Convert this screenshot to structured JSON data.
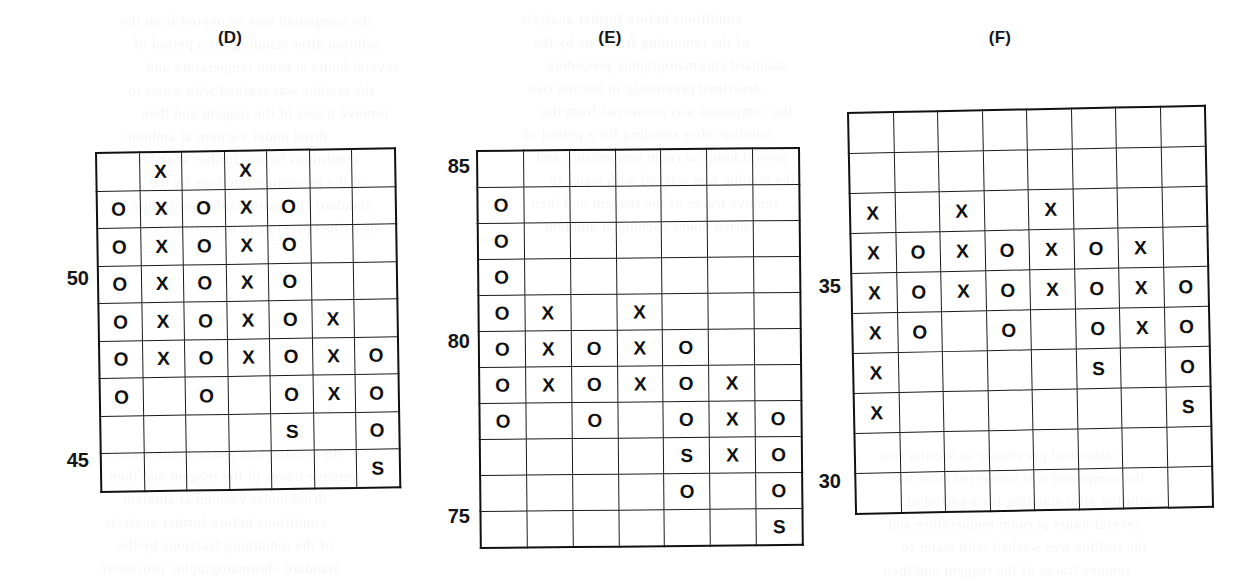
{
  "figure": {
    "background_color": "#ffffff",
    "ink_color": "#111111",
    "symbols": {
      "x": "X",
      "o": "O",
      "s": "S",
      "blank": ""
    }
  },
  "panels": [
    {
      "id": "panel-d",
      "label": "(D)",
      "columns": 7,
      "rows": 9,
      "axis_ticks": [
        {
          "text": "50",
          "row_index": 3
        },
        {
          "text": "45",
          "row_index": 8
        }
      ],
      "cells": [
        [
          "",
          "X",
          "",
          "X",
          "",
          "",
          ""
        ],
        [
          "O",
          "X",
          "O",
          "X",
          "O",
          "",
          ""
        ],
        [
          "O",
          "X",
          "O",
          "X",
          "O",
          "",
          ""
        ],
        [
          "O",
          "X",
          "O",
          "X",
          "O",
          "",
          ""
        ],
        [
          "O",
          "X",
          "O",
          "X",
          "O",
          "X",
          ""
        ],
        [
          "O",
          "X",
          "O",
          "X",
          "O",
          "X",
          "O"
        ],
        [
          "O",
          "",
          "O",
          "",
          "O",
          "X",
          "O"
        ],
        [
          "",
          "",
          "",
          "",
          "S",
          "",
          "O"
        ],
        [
          "",
          "",
          "",
          "",
          "",
          "",
          "S"
        ]
      ]
    },
    {
      "id": "panel-e",
      "label": "(E)",
      "columns": 7,
      "rows": 11,
      "axis_ticks": [
        {
          "text": "85",
          "row_index": 0
        },
        {
          "text": "80",
          "row_index": 5
        },
        {
          "text": "75",
          "row_index": 10
        }
      ],
      "cells": [
        [
          "",
          "",
          "",
          "",
          "",
          "",
          ""
        ],
        [
          "O",
          "",
          "",
          "",
          "",
          "",
          ""
        ],
        [
          "O",
          "",
          "",
          "",
          "",
          "",
          ""
        ],
        [
          "O",
          "",
          "",
          "",
          "",
          "",
          ""
        ],
        [
          "O",
          "X",
          "",
          "X",
          "",
          "",
          ""
        ],
        [
          "O",
          "X",
          "O",
          "X",
          "O",
          "",
          ""
        ],
        [
          "O",
          "X",
          "O",
          "X",
          "O",
          "X",
          ""
        ],
        [
          "O",
          "",
          "O",
          "",
          "O",
          "X",
          "O"
        ],
        [
          "",
          "",
          "",
          "",
          "S",
          "X",
          "O"
        ],
        [
          "",
          "",
          "",
          "",
          "O",
          "",
          "O"
        ],
        [
          "",
          "",
          "",
          "",
          "",
          "",
          "S"
        ]
      ]
    },
    {
      "id": "panel-f",
      "label": "(F)",
      "columns": 8,
      "rows": 10,
      "axis_ticks": [
        {
          "text": "35",
          "row_index": 4
        },
        {
          "text": "30",
          "row_index": 9
        }
      ],
      "cells": [
        [
          "",
          "",
          "",
          "",
          "",
          "",
          "",
          ""
        ],
        [
          "",
          "",
          "",
          "",
          "",
          "",
          "",
          ""
        ],
        [
          "X",
          "",
          "X",
          "",
          "X",
          "",
          "",
          ""
        ],
        [
          "X",
          "O",
          "X",
          "O",
          "X",
          "O",
          "X",
          ""
        ],
        [
          "X",
          "O",
          "X",
          "O",
          "X",
          "O",
          "X",
          "O"
        ],
        [
          "X",
          "O",
          "",
          "O",
          "",
          "O",
          "X",
          "O"
        ],
        [
          "X",
          "",
          "",
          "",
          "",
          "S",
          "",
          "O"
        ],
        [
          "X",
          "",
          "",
          "",
          "",
          "",
          "",
          "S"
        ],
        [
          "",
          "",
          "",
          "",
          "",
          "",
          "",
          ""
        ],
        [
          "",
          "",
          "",
          "",
          "",
          "",
          "",
          ""
        ]
      ]
    }
  ],
  "bleed_text": [
    "the compound was recovered from the",
    "solution after standing for a period of",
    "several hours at room temperature and",
    "the residue was washed with water to",
    "remove traces of the reagent and then",
    "dried under vacuum at ambient",
    "conditions before further analysis",
    "of the remaining fractions by the",
    "standard chromatographic procedure",
    "described previously in section two"
  ]
}
